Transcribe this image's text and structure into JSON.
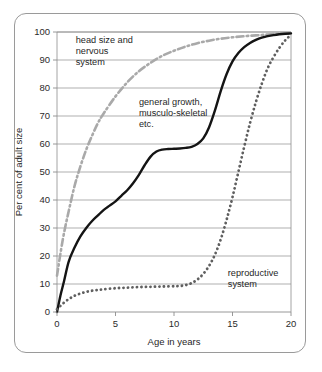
{
  "figure": {
    "border_color": "#9a9a9a",
    "background": "#ffffff"
  },
  "chart_data": {
    "type": "line",
    "title": "",
    "subtitle": "",
    "xlabel": "Age in years",
    "ylabel": "Per cent  of adult size",
    "xlim": [
      0,
      20
    ],
    "ylim": [
      0,
      100
    ],
    "xticks": [
      0,
      5,
      10,
      15,
      20
    ],
    "xtick_labels": [
      "0",
      "5",
      "10",
      "15",
      "20"
    ],
    "yticks": [
      0,
      10,
      20,
      30,
      40,
      50,
      60,
      70,
      80,
      90,
      100
    ],
    "ytick_labels": [
      "0",
      "10",
      "20",
      "30",
      "40",
      "50",
      "60",
      "70",
      "80",
      "90",
      "100"
    ],
    "grid": "horizontal",
    "legend": "none",
    "annotations": [
      {
        "name": "neural-curve-label",
        "lines": [
          "head size and",
          "nervous",
          "system"
        ],
        "x": 1.6,
        "y": 96
      },
      {
        "name": "general-growth-label",
        "lines": [
          "general growth,",
          "musculo-skeletal",
          "etc."
        ],
        "x": 7.0,
        "y": 74
      },
      {
        "name": "reproductive-label",
        "lines": [
          "reproductive",
          "system"
        ],
        "x": 14.6,
        "y": 13
      }
    ],
    "series": [
      {
        "name": "head size and nervous system",
        "style": "dash-dot",
        "color": "#a9a9a9",
        "width": 2.6,
        "x": [
          0,
          0.5,
          1,
          1.5,
          2,
          2.5,
          3,
          3.5,
          4,
          5,
          6,
          7,
          8,
          9,
          10,
          11,
          12,
          13,
          14,
          15,
          16,
          17,
          18,
          19,
          20
        ],
        "values": [
          13,
          26,
          36,
          45,
          52,
          58,
          63,
          67.5,
          71,
          77,
          82,
          86,
          89,
          91.5,
          93.3,
          94.8,
          96,
          96.9,
          97.6,
          98.1,
          98.5,
          98.8,
          99.1,
          99.4,
          99.6
        ]
      },
      {
        "name": "general growth, musculo-skeletal etc.",
        "style": "solid",
        "color": "#141414",
        "width": 2.4,
        "x": [
          0,
          0.3,
          0.6,
          1,
          1.5,
          2,
          2.5,
          3,
          3.5,
          4,
          4.5,
          5,
          5.5,
          6,
          6.5,
          7,
          7.5,
          8,
          8.5,
          9,
          9.5,
          10,
          10.5,
          11,
          11.5,
          12,
          12.5,
          13,
          13.5,
          14,
          14.5,
          15,
          15.5,
          16,
          16.5,
          17,
          17.5,
          18,
          18.5,
          19,
          19.5,
          20
        ],
        "values": [
          0,
          6,
          11,
          18,
          23,
          27,
          30,
          32.5,
          34.5,
          36.5,
          38,
          39.5,
          41.5,
          43.5,
          46,
          49,
          52.5,
          55.5,
          57.3,
          58,
          58.2,
          58.3,
          58.4,
          58.6,
          59,
          60,
          62,
          66,
          72,
          79,
          85,
          89.5,
          92.5,
          94.6,
          96.1,
          97.2,
          98,
          98.5,
          98.9,
          99.2,
          99.4,
          99.5
        ]
      },
      {
        "name": "reproductive system",
        "style": "dotted",
        "color": "#5f5f5f",
        "width": 2.8,
        "x": [
          0,
          0.5,
          1,
          1.5,
          2,
          2.5,
          3,
          3.5,
          4,
          5,
          6,
          7,
          8,
          9,
          10,
          10.5,
          11,
          11.5,
          12,
          12.5,
          13,
          13.5,
          14,
          14.5,
          15,
          15.5,
          16,
          16.5,
          17,
          17.5,
          18,
          18.5,
          19,
          19.5,
          20
        ],
        "values": [
          1,
          3,
          4.6,
          5.8,
          6.6,
          7.2,
          7.6,
          7.9,
          8.1,
          8.5,
          8.7,
          8.9,
          9,
          9.1,
          9.2,
          9.3,
          9.6,
          10.3,
          11.6,
          13.6,
          16.5,
          20.5,
          26,
          33,
          41,
          50,
          59,
          67.5,
          75,
          81.5,
          87,
          91,
          94.3,
          97,
          99
        ]
      }
    ]
  }
}
